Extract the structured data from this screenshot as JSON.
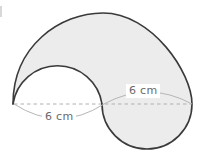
{
  "figure": {
    "kind": "geometry-diagram",
    "colors": {
      "fill": "#ececec",
      "outline": "#3a3a3a",
      "dashed_line": "#b0b0b0",
      "label_text": "#6a6a6a",
      "background": "#ffffff",
      "corner_mark": "#d8d8d8"
    },
    "dimensions": {
      "upper_right": {
        "value": "6",
        "unit": "cm",
        "text": "6 cm"
      },
      "lower_left": {
        "value": "6",
        "unit": "cm",
        "text": "6 cm"
      }
    },
    "geometry": {
      "large_circle": {
        "center_x": 147,
        "center_y": 104,
        "radius": 45
      },
      "small_semicircle": {
        "center_x": 58,
        "center_y": 104,
        "radius": 45
      },
      "baseline_y": 104,
      "baseline_x_start": 14,
      "baseline_x_end": 192
    }
  }
}
